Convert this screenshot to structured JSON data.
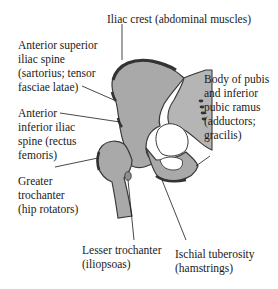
{
  "figure": {
    "colors": {
      "bone_fill": "#a9a9a9",
      "bone_outline": "#3a3a3a",
      "attachment_mark": "#333333",
      "text": "#1a1a1a",
      "background": "#ffffff"
    }
  },
  "labels": {
    "iliac_crest": [
      "Iliac crest (abdominal muscles)"
    ],
    "asis": [
      "Anterior superior",
      "iliac spine",
      "(sartorius; tensor",
      "fasciae latae)"
    ],
    "aiis": [
      "Anterior",
      "inferior iliac",
      "spine (rectus",
      "femoris)"
    ],
    "greater_trochanter": [
      "Greater",
      "trochanter",
      "(hip rotators)"
    ],
    "lesser_trochanter": [
      "Lesser trochanter",
      "(iliopsoas)"
    ],
    "ischial_tuberosity": [
      "Ischial tuberosity",
      "(hamstrings)"
    ],
    "pubis": [
      "Body of pubis",
      "and inferior",
      "pubic ramus",
      "(adductors;",
      "gracilis)"
    ]
  }
}
